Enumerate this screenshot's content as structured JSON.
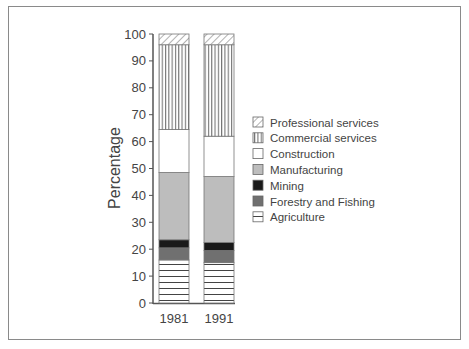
{
  "chart_data": {
    "type": "bar",
    "stacked": true,
    "title": "",
    "xlabel": "",
    "ylabel": "Percentage",
    "ylim": [
      0,
      100
    ],
    "yticks": [
      0,
      10,
      20,
      30,
      40,
      50,
      60,
      70,
      80,
      90,
      100
    ],
    "grid": false,
    "legend_position": "right",
    "categories": [
      "1981",
      "1991"
    ],
    "series": [
      {
        "name": "Agriculture",
        "values": [
          16,
          15
        ],
        "pattern": "horizontal-lines"
      },
      {
        "name": "Forestry and Fishing",
        "values": [
          4.5,
          4.5
        ],
        "pattern": "solid",
        "color": "#707070"
      },
      {
        "name": "Mining",
        "values": [
          3,
          3
        ],
        "pattern": "solid",
        "color": "#1a1a1a"
      },
      {
        "name": "Manufacturing",
        "values": [
          25,
          24.5
        ],
        "pattern": "solid",
        "color": "#bdbdbd"
      },
      {
        "name": "Construction",
        "values": [
          16,
          15
        ],
        "pattern": "solid",
        "color": "#ffffff"
      },
      {
        "name": "Commercial services",
        "values": [
          31.5,
          34
        ],
        "pattern": "vertical-lines"
      },
      {
        "name": "Professional services",
        "values": [
          4,
          4
        ],
        "pattern": "diagonal-hatch"
      }
    ],
    "legend_order": [
      "Professional services",
      "Commercial services",
      "Construction",
      "Manufacturing",
      "Mining",
      "Forestry and Fishing",
      "Agriculture"
    ]
  }
}
